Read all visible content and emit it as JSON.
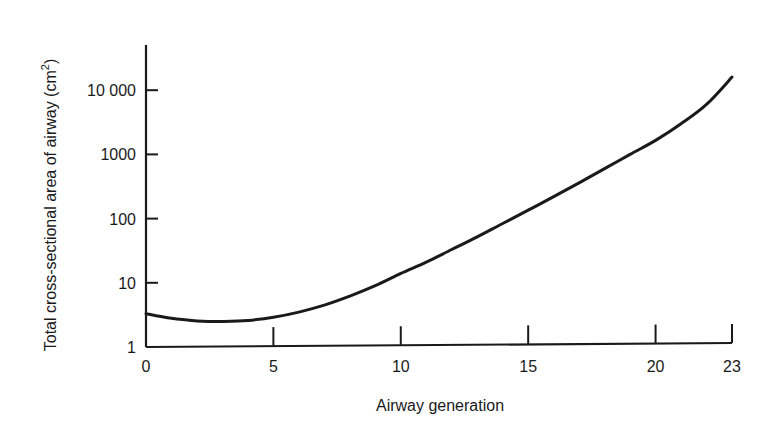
{
  "chart_data": {
    "type": "line",
    "title": "",
    "xlabel": "Airway generation",
    "ylabel": "Total cross-sectional area of airway (cm²)",
    "ylabel_main": "Total cross-sectional area of airway (cm",
    "ylabel_sup": "2",
    "ylabel_close": ")",
    "yscale": "log",
    "xlim": [
      0,
      23
    ],
    "ylim": [
      1,
      30000
    ],
    "grid": false,
    "legend": null,
    "x_ticks": [
      {
        "value": 0,
        "label": "0"
      },
      {
        "value": 5,
        "label": "5"
      },
      {
        "value": 10,
        "label": "10"
      },
      {
        "value": 15,
        "label": "15"
      },
      {
        "value": 20,
        "label": "20"
      },
      {
        "value": 23,
        "label": "23"
      }
    ],
    "y_ticks": [
      {
        "value": 1,
        "label": "1"
      },
      {
        "value": 10,
        "label": "10"
      },
      {
        "value": 100,
        "label": "100"
      },
      {
        "value": 1000,
        "label": "1000"
      },
      {
        "value": 10000,
        "label": "10 000"
      }
    ],
    "series": [
      {
        "name": "Total cross-sectional area",
        "color": "#1a1a1a",
        "x": [
          0,
          1,
          2,
          2.5,
          3,
          4,
          5,
          6,
          7,
          8,
          9,
          10,
          11,
          12,
          13,
          14,
          15,
          16,
          17,
          18,
          19,
          20,
          21,
          22,
          23
        ],
        "y": [
          3.3,
          2.8,
          2.55,
          2.5,
          2.5,
          2.6,
          2.9,
          3.5,
          4.5,
          6.2,
          9,
          14,
          21,
          33,
          52,
          84,
          135,
          220,
          360,
          600,
          1000,
          1650,
          3000,
          6000,
          16000
        ]
      }
    ]
  }
}
